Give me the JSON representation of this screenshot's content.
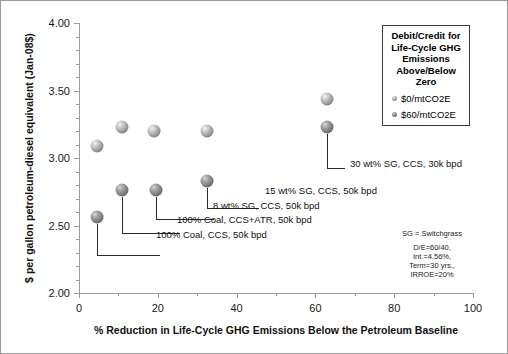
{
  "chart_data": {
    "type": "scatter",
    "title": "",
    "xlabel": "% Reduction in Life-Cycle GHG Emissions Below the Petroleum Baseline",
    "ylabel": "$ per gallon petroleum-diesel equivalent (Jan-08$)",
    "xlim": [
      0,
      100
    ],
    "ylim": [
      2.0,
      4.0
    ],
    "xticks": [
      0,
      20,
      40,
      60,
      80,
      100
    ],
    "yticks": [
      "2.00",
      "2.50",
      "3.00",
      "3.50",
      "4.00"
    ],
    "xtick_labels": [
      "0",
      "20",
      "40",
      "60",
      "80",
      "100"
    ],
    "grid": false,
    "legend_position": "top-right",
    "series": [
      {
        "name": "$0/mtCO2E",
        "points": [
          {
            "x": 4.5,
            "y": 3.09,
            "label": "100% Coal, CCS, 50k bpd"
          },
          {
            "x": 11.0,
            "y": 3.23,
            "label": "100% Coal, CCS+ATR, 50k bpd"
          },
          {
            "x": 19.0,
            "y": 3.2,
            "label": "8 wt% SG, CCS, 50k bpd"
          },
          {
            "x": 32.5,
            "y": 3.2,
            "label": "15 wt% SG, CCS, 50k bpd"
          },
          {
            "x": 63.0,
            "y": 3.44,
            "label": "30 wt% SG, CCS, 30k bpd"
          }
        ]
      },
      {
        "name": "$60/mtCO2E",
        "points": [
          {
            "x": 4.5,
            "y": 2.56,
            "label": "100% Coal, CCS, 50k bpd"
          },
          {
            "x": 11.0,
            "y": 2.76,
            "label": "100% Coal, CCS+ATR, 50k bpd"
          },
          {
            "x": 19.5,
            "y": 2.76,
            "label": "8 wt% SG, CCS, 50k bpd"
          },
          {
            "x": 32.5,
            "y": 2.83,
            "label": "15 wt% SG, CCS, 50k bpd"
          },
          {
            "x": 63.0,
            "y": 3.23,
            "label": "30 wt% SG, CCS, 30k bpd"
          }
        ]
      }
    ],
    "annotations": [
      "30 wt% SG, CCS, 30k bpd",
      "15 wt% SG, CCS, 50k bpd",
      "8 wt% SG, CCS, 50k bpd",
      "100% Coal, CCS+ATR, 50k bpd",
      "100% Coal, CCS, 50k bpd"
    ]
  },
  "legend": {
    "title_lines": [
      "Debit/Credit for",
      "Life-Cycle GHG",
      "Emissions",
      "Above/Below",
      "Zero"
    ],
    "entries": [
      {
        "label": "$0/mtCO2E",
        "color": "#8a8a8a"
      },
      {
        "label": "$60/mtCO2E",
        "color": "#6f6f6f"
      }
    ]
  },
  "notes": {
    "sg": "SG = Switchgrass",
    "lines": [
      "D/E=60/40,",
      "Int.=4.56%,",
      "Term=30 yrs.,",
      "IRROE=20%"
    ]
  },
  "axes": {
    "y_title": "$ per gallon petroleum-diesel equivalent (Jan-08$)",
    "x_title": "% Reduction in Life-Cycle GHG Emissions Below the Petroleum Baseline",
    "y_labels": [
      "4.00",
      "3.50",
      "3.00",
      "2.50",
      "2.00"
    ],
    "x_labels": [
      "0",
      "20",
      "40",
      "60",
      "80",
      "100"
    ]
  }
}
